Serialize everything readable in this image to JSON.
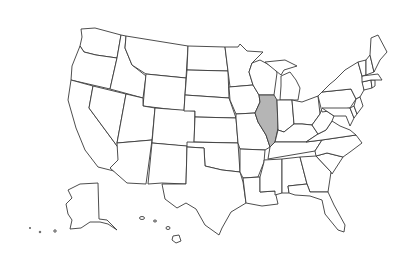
{
  "map": {
    "title": "United States",
    "highlighted_state": "Illinois",
    "highlight_color": "#b5b5b5",
    "default_fill": "#ffffff",
    "stroke_color": "#3a3a3a",
    "states": [
      "Washington",
      "Oregon",
      "California",
      "Idaho",
      "Nevada",
      "Montana",
      "Wyoming",
      "Utah",
      "Arizona",
      "Colorado",
      "New Mexico",
      "North Dakota",
      "South Dakota",
      "Nebraska",
      "Kansas",
      "Oklahoma",
      "Texas",
      "Minnesota",
      "Iowa",
      "Missouri",
      "Arkansas",
      "Louisiana",
      "Wisconsin",
      "Illinois",
      "Michigan",
      "Indiana",
      "Ohio",
      "Kentucky",
      "Tennessee",
      "Mississippi",
      "Alabama",
      "Georgia",
      "Florida",
      "South Carolina",
      "North Carolina",
      "Virginia",
      "West Virginia",
      "Pennsylvania",
      "New York",
      "Maryland",
      "Delaware",
      "New Jersey",
      "Connecticut",
      "Rhode Island",
      "Massachusetts",
      "Vermont",
      "New Hampshire",
      "Maine",
      "Alaska",
      "Hawaii"
    ]
  }
}
